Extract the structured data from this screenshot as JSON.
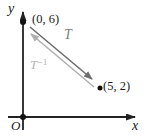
{
  "diagram": {
    "axes": {
      "x_label": "x",
      "y_label": "y",
      "origin_label": "O"
    },
    "points": [
      {
        "label": "(0, 6)",
        "x": 0,
        "y": 6
      },
      {
        "label": "(5, 2)",
        "x": 5,
        "y": 2
      }
    ],
    "transform_arrows": [
      {
        "label": "T",
        "from": "(0, 6)",
        "to": "(5, 2)",
        "color": "#6e6e6e"
      },
      {
        "label": "T−1",
        "from": "(5, 2)",
        "to": "(0, 6)",
        "color": "#b0b0b0"
      }
    ],
    "labels": {
      "t": "T",
      "t_inverse_base": "T",
      "t_inverse_exponent": "−1"
    },
    "colors": {
      "axis": "#222222",
      "point": "#111111",
      "t_arrow": "#6e6e6e",
      "t_inverse_arrow": "#b0b0b0"
    }
  }
}
